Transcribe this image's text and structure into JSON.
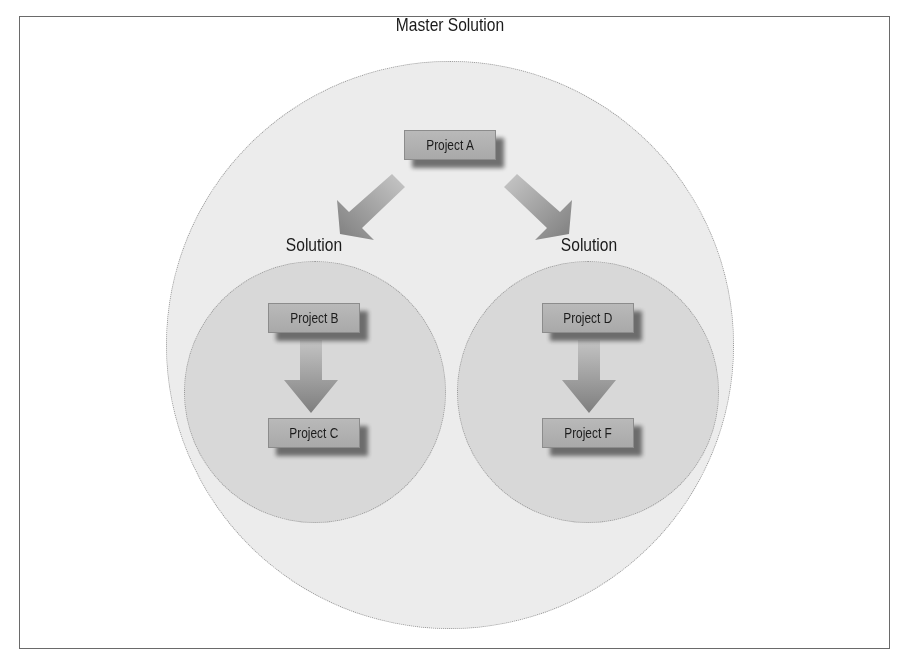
{
  "diagram": {
    "title": "Master Solution",
    "solutions": [
      {
        "label": "Solution",
        "projects": [
          "Project B",
          "Project C"
        ]
      },
      {
        "label": "Solution",
        "projects": [
          "Project D",
          "Project F"
        ]
      }
    ],
    "root_project": "Project A",
    "edges": [
      {
        "from": "Project A",
        "to": "Solution (left)"
      },
      {
        "from": "Project A",
        "to": "Solution (right)"
      },
      {
        "from": "Project B",
        "to": "Project C"
      },
      {
        "from": "Project D",
        "to": "Project F"
      }
    ],
    "colors": {
      "master_circle": "#ececec",
      "solution_circle": "#d8d8d8",
      "box_face": "#b0b0b0",
      "box_shadow": "#5a5a5a",
      "arrow": "#8a8a8a",
      "frame_border": "#6a6a6a"
    }
  }
}
